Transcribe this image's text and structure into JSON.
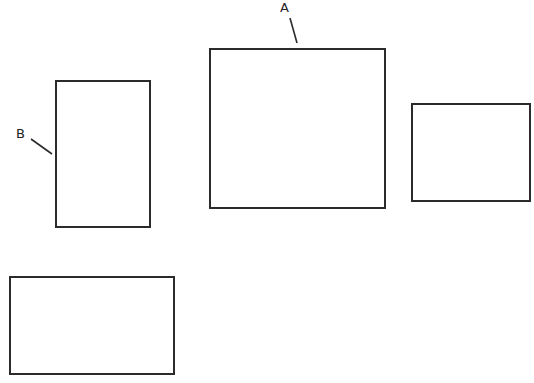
{
  "diagram": {
    "stroke_color": "#2b2b2b",
    "background": "#ffffff",
    "labels": {
      "a": "A",
      "b": "B"
    },
    "shapes": [
      {
        "id": "rect-b",
        "label": "B",
        "x": 55,
        "y": 80,
        "w": 96,
        "h": 148
      },
      {
        "id": "rect-a",
        "label": "A",
        "x": 209,
        "y": 48,
        "w": 177,
        "h": 161
      },
      {
        "id": "rect-right",
        "label": "",
        "x": 411,
        "y": 103,
        "w": 120,
        "h": 99
      },
      {
        "id": "rect-bottom",
        "label": "",
        "x": 9,
        "y": 276,
        "w": 166,
        "h": 99
      }
    ],
    "leader_lines": [
      {
        "for": "A",
        "x1": 290,
        "y1": 18,
        "x2": 297,
        "y2": 43
      },
      {
        "for": "B",
        "x1": 31,
        "y1": 139,
        "x2": 52,
        "y2": 154
      }
    ]
  }
}
